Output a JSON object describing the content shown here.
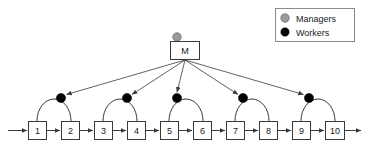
{
  "figure": {
    "background_color": "#ffffff",
    "line_color": "#3a3a3a"
  },
  "legend": {
    "box": {
      "x": 275,
      "y": 8,
      "width": 80,
      "height": 34,
      "border_color": "#8a8a8a",
      "fill": "#ffffff"
    },
    "items": [
      {
        "label": "Managers",
        "marker": "circle",
        "color": "#9a9a9a",
        "stroke": "#6d6d6d",
        "icon": "manager-circle-icon"
      },
      {
        "label": "Workers",
        "marker": "circle",
        "color": "#000000",
        "stroke": "#000000",
        "icon": "worker-dot-icon"
      }
    ]
  },
  "manager": {
    "label": "M",
    "box": {
      "x": 170,
      "y": 41,
      "width": 30,
      "height": 19
    },
    "marker": {
      "cx": 177,
      "cy": 37,
      "r": 4.2,
      "color": "#9a9a9a"
    },
    "fan_origin": {
      "x": 185,
      "y": 60
    }
  },
  "chain": {
    "entry_arrow_label": "",
    "exit_arrow_label": "",
    "box_size": {
      "width": 19,
      "height": 19
    },
    "box_y": 121,
    "nodes": [
      {
        "label": "1",
        "x": 28
      },
      {
        "label": "2",
        "x": 61
      },
      {
        "label": "3",
        "x": 94
      },
      {
        "label": "4",
        "x": 127
      },
      {
        "label": "5",
        "x": 160
      },
      {
        "label": "6",
        "x": 193
      },
      {
        "label": "7",
        "x": 226
      },
      {
        "label": "8",
        "x": 259
      },
      {
        "label": "9",
        "x": 292
      },
      {
        "label": "10",
        "x": 325
      }
    ]
  },
  "workers": [
    {
      "id": "worker-1",
      "pair": "1-2",
      "cx": 61,
      "cy": 98,
      "color": "#000000",
      "r": 4.6
    },
    {
      "id": "worker-2",
      "pair": "3-4",
      "cx": 127,
      "cy": 98,
      "color": "#000000",
      "r": 4.6
    },
    {
      "id": "worker-3",
      "pair": "5-6",
      "cx": 177,
      "cy": 98,
      "color": "#000000",
      "r": 4.6
    },
    {
      "id": "worker-4",
      "pair": "7-8",
      "cx": 243,
      "cy": 98,
      "color": "#000000",
      "r": 4.6
    },
    {
      "id": "worker-5",
      "pair": "9-10",
      "cx": 309,
      "cy": 98,
      "color": "#000000",
      "r": 4.6
    }
  ],
  "arcs": [
    {
      "id": "arc-1",
      "from_node": "1",
      "to_node": "2",
      "x1": 37,
      "x2": 71,
      "apex_y": 99
    },
    {
      "id": "arc-2",
      "from_node": "3",
      "to_node": "4",
      "x1": 103,
      "x2": 137,
      "apex_y": 99
    },
    {
      "id": "arc-3",
      "from_node": "5",
      "to_node": "6",
      "x1": 169,
      "x2": 203,
      "apex_y": 99
    },
    {
      "id": "arc-4",
      "from_node": "7",
      "to_node": "8",
      "x1": 235,
      "x2": 269,
      "apex_y": 99
    },
    {
      "id": "arc-5",
      "from_node": "9",
      "to_node": "10",
      "x1": 301,
      "x2": 335,
      "apex_y": 99
    }
  ],
  "manager_edges": [
    {
      "id": "edge-to-worker-1",
      "target": "worker-1"
    },
    {
      "id": "edge-to-worker-2",
      "target": "worker-2"
    },
    {
      "id": "edge-to-worker-3",
      "target": "worker-3"
    },
    {
      "id": "edge-to-worker-4",
      "target": "worker-4"
    },
    {
      "id": "edge-to-worker-5",
      "target": "worker-5"
    }
  ]
}
